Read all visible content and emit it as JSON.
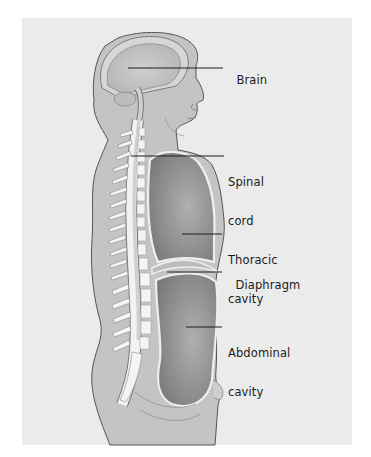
{
  "figure": {
    "colors": {
      "background": "#ebebeb",
      "body_fill": "#c4c4c4",
      "outline": "#555555",
      "cavity_fill": "#8c8c8c",
      "bone_fill": "#f2f2f2",
      "leader_line": "#1c1c1c"
    }
  },
  "labels": [
    {
      "id": "brain",
      "line1": "Brain",
      "line2": ""
    },
    {
      "id": "spinal-cord",
      "line1": "Spinal",
      "line2": "cord"
    },
    {
      "id": "thoracic-cavity",
      "line1": "Thoracic",
      "line2": "cavity"
    },
    {
      "id": "diaphragm",
      "line1": "Diaphragm",
      "line2": ""
    },
    {
      "id": "abdominal-cavity",
      "line1": "Abdominal",
      "line2": "cavity"
    }
  ]
}
